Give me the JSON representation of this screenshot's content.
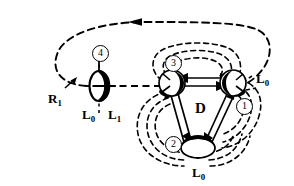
{
  "figure": {
    "background_color": "#ffffff",
    "stroke_color": "#000000",
    "labels": {
      "region_r1": "R",
      "region_r1_sub": "1",
      "lens_left": "L",
      "lens_left_sub": "0",
      "lens_right": "L",
      "lens_right_sub": "1",
      "disc": "D",
      "loop_right": "L",
      "loop_right_sub": "0",
      "loop_bottom": "L",
      "loop_bottom_sub": "0"
    },
    "markers": {
      "one": "1",
      "two": "2",
      "three": "3",
      "four": "4"
    }
  }
}
